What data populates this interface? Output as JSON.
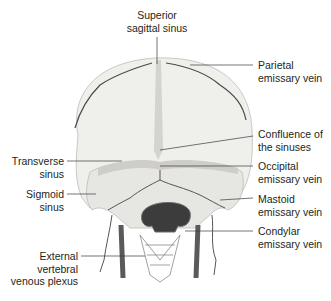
{
  "figure": {
    "colors": {
      "bone": "#efefec",
      "bone_shadow": "#c9c9c4",
      "sinus": "#c4c2bd",
      "vein": "#4a4a4a",
      "leader_line": "#3a3a3a",
      "text": "#231f20"
    }
  },
  "labels": {
    "superior_sagittal_sinus": {
      "line1": "Superior",
      "line2": "sagittal sinus"
    },
    "parietal_emissary_vein": {
      "line1": "Parietal",
      "line2": "emissary vein"
    },
    "confluence_of_sinuses": {
      "line1": "Confluence of",
      "line2": "the sinuses"
    },
    "occipital_emissary_vein": {
      "line1": "Occipital",
      "line2": "emissary vein"
    },
    "mastoid_emissary_vein": {
      "line1": "Mastoid",
      "line2": "emissary vein"
    },
    "condylar_emissary_vein": {
      "line1": "Condylar",
      "line2": "emissary vein"
    },
    "transverse_sinus": {
      "line1": "Transverse",
      "line2": "sinus"
    },
    "sigmoid_sinus": {
      "line1": "Sigmoid",
      "line2": "sinus"
    },
    "external_vertebral_venous_plexus": {
      "line1": "External",
      "line2": "vertebral",
      "line3": "venous plexus"
    }
  }
}
